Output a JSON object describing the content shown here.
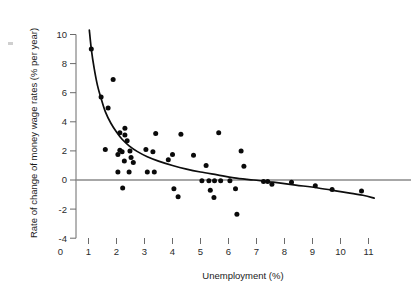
{
  "chart_data": {
    "type": "scatter",
    "title": "",
    "subtitle": "",
    "xlabel": "Unemployment (%)",
    "ylabel": "Rate of change of money wage rates (% per year)",
    "xlim": [
      0,
      11
    ],
    "ylim": [
      -4,
      10
    ],
    "xticks": [
      0,
      1,
      2,
      3,
      4,
      5,
      6,
      7,
      8,
      9,
      10,
      11
    ],
    "xtick_labels": [
      "0",
      "1",
      "2",
      "3",
      "4",
      "5",
      "6",
      "7",
      "8",
      "9",
      "10",
      "11"
    ],
    "yticks": [
      -4,
      -2,
      0,
      2,
      4,
      6,
      8,
      10
    ],
    "ytick_labels": [
      "-4",
      "-2",
      "0",
      "2",
      "4",
      "6",
      "8",
      "10"
    ],
    "grid": false,
    "legend": false,
    "zero_reference_line": 0,
    "points": [
      [
        1.1,
        9.0
      ],
      [
        1.88,
        6.9
      ],
      [
        1.45,
        5.7
      ],
      [
        1.7,
        4.95
      ],
      [
        2.12,
        3.25
      ],
      [
        2.3,
        3.55
      ],
      [
        2.3,
        3.1
      ],
      [
        2.38,
        2.7
      ],
      [
        2.12,
        2.05
      ],
      [
        2.2,
        1.95
      ],
      [
        1.6,
        2.1
      ],
      [
        2.05,
        1.75
      ],
      [
        2.48,
        2.0
      ],
      [
        2.52,
        1.55
      ],
      [
        2.28,
        1.3
      ],
      [
        2.6,
        1.2
      ],
      [
        2.05,
        0.55
      ],
      [
        2.45,
        0.55
      ],
      [
        2.22,
        -0.55
      ],
      [
        3.4,
        3.2
      ],
      [
        4.3,
        3.15
      ],
      [
        5.65,
        3.25
      ],
      [
        3.05,
        2.1
      ],
      [
        3.3,
        1.95
      ],
      [
        3.85,
        1.4
      ],
      [
        4.0,
        1.75
      ],
      [
        4.75,
        1.7
      ],
      [
        3.1,
        0.55
      ],
      [
        3.35,
        0.55
      ],
      [
        4.05,
        -0.6
      ],
      [
        4.2,
        -1.15
      ],
      [
        5.2,
        1.0
      ],
      [
        5.05,
        -0.05
      ],
      [
        5.3,
        -0.05
      ],
      [
        5.5,
        -0.05
      ],
      [
        5.72,
        -0.05
      ],
      [
        5.35,
        -0.7
      ],
      [
        5.48,
        -1.2
      ],
      [
        6.05,
        -0.05
      ],
      [
        6.25,
        -0.6
      ],
      [
        6.3,
        -2.35
      ],
      [
        6.45,
        2.0
      ],
      [
        6.55,
        0.95
      ],
      [
        7.25,
        -0.1
      ],
      [
        7.4,
        -0.1
      ],
      [
        7.55,
        -0.3
      ],
      [
        8.25,
        -0.15
      ],
      [
        9.1,
        -0.4
      ],
      [
        9.7,
        -0.65
      ],
      [
        10.75,
        -0.75
      ]
    ],
    "fit_curve": {
      "name": "fitted Phillips curve",
      "points": [
        [
          1.03,
          10.3
        ],
        [
          1.1,
          9.0
        ],
        [
          1.2,
          7.7
        ],
        [
          1.32,
          6.5
        ],
        [
          1.45,
          5.6
        ],
        [
          1.6,
          4.7
        ],
        [
          1.8,
          3.9
        ],
        [
          2.0,
          3.3
        ],
        [
          2.2,
          2.8
        ],
        [
          2.45,
          2.35
        ],
        [
          2.75,
          1.95
        ],
        [
          3.1,
          1.6
        ],
        [
          3.5,
          1.3
        ],
        [
          4.0,
          1.0
        ],
        [
          4.5,
          0.75
        ],
        [
          5.0,
          0.55
        ],
        [
          5.6,
          0.35
        ],
        [
          6.2,
          0.15
        ],
        [
          6.9,
          0.0
        ],
        [
          7.6,
          -0.15
        ],
        [
          8.4,
          -0.35
        ],
        [
          9.2,
          -0.55
        ],
        [
          10.0,
          -0.8
        ],
        [
          10.8,
          -1.05
        ],
        [
          11.2,
          -1.25
        ]
      ]
    }
  },
  "colors": {
    "point": "#0a0a0a",
    "curve": "#0d0d0d",
    "axis": "#6b6b6b",
    "zero_line": "#8a8a8a",
    "background": "#ffffff"
  }
}
